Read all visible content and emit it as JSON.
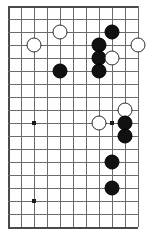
{
  "board": {
    "title": "Go board position diagram",
    "kind": "go-board-diagram",
    "grid": {
      "columns": 11,
      "rows": 18,
      "cell_size": 13,
      "origin_x": 8,
      "origin_y": 6,
      "line_color": "#6b6b6b",
      "edge_color": "#4a4a4a",
      "background_color": "#ffffff"
    },
    "edges": {
      "top": true,
      "left": true,
      "bottom": true,
      "right": false
    },
    "star_points": [
      {
        "col": 2,
        "row": 3
      },
      {
        "col": 2,
        "row": 9
      },
      {
        "col": 2,
        "row": 15
      },
      {
        "col": 8,
        "row": 9
      }
    ],
    "stone_colors": {
      "black": "#111111",
      "white": "#ffffff",
      "white_outline": "#2b2b2b"
    },
    "stones": [
      {
        "color": "black",
        "col": 8,
        "row": 2
      },
      {
        "color": "white",
        "col": 4,
        "row": 2
      },
      {
        "color": "white",
        "col": 2,
        "row": 3
      },
      {
        "color": "black",
        "col": 7,
        "row": 3
      },
      {
        "color": "white",
        "col": 10,
        "row": 3
      },
      {
        "color": "black",
        "col": 7,
        "row": 4
      },
      {
        "color": "white",
        "col": 8,
        "row": 4
      },
      {
        "color": "black",
        "col": 4,
        "row": 5
      },
      {
        "color": "black",
        "col": 7,
        "row": 5
      },
      {
        "color": "white",
        "col": 9,
        "row": 8
      },
      {
        "color": "white",
        "col": 7,
        "row": 9
      },
      {
        "color": "black",
        "col": 9,
        "row": 9
      },
      {
        "color": "black",
        "col": 9,
        "row": 10
      },
      {
        "color": "black",
        "col": 8,
        "row": 12
      },
      {
        "color": "black",
        "col": 8,
        "row": 14
      }
    ]
  }
}
